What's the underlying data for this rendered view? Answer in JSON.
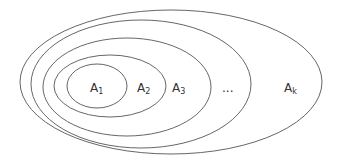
{
  "diagram": {
    "type": "nested-sets",
    "stroke_color": "#555555",
    "background": "#ffffff",
    "sets": [
      {
        "name": "A1",
        "base": "A",
        "sub": "1",
        "cx": 97,
        "cy": 86,
        "rx": 30,
        "ry": 22,
        "label_x": 90,
        "label_y": 92
      },
      {
        "name": "A2",
        "base": "A",
        "sub": "2",
        "cx": 110,
        "cy": 86,
        "rx": 56,
        "ry": 31,
        "label_x": 137,
        "label_y": 92
      },
      {
        "name": "A3",
        "base": "A",
        "sub": "3",
        "cx": 127,
        "cy": 87,
        "rx": 84,
        "ry": 49,
        "label_x": 172,
        "label_y": 92
      },
      {
        "name": "...",
        "base": "...",
        "sub": "",
        "cx": 141,
        "cy": 84,
        "rx": 110,
        "ry": 64,
        "label_x": 222,
        "label_y": 92
      },
      {
        "name": "Ak",
        "base": "A",
        "sub": "k",
        "cx": 171,
        "cy": 82,
        "rx": 151,
        "ry": 72,
        "label_x": 284,
        "label_y": 92
      }
    ]
  }
}
